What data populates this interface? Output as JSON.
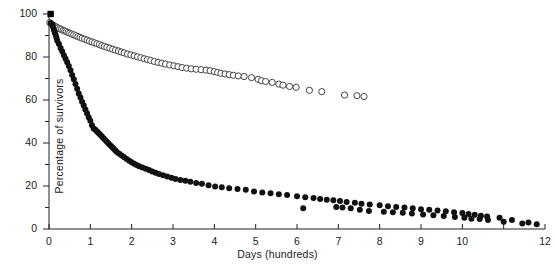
{
  "chart_data": {
    "type": "scatter",
    "title": "",
    "xlabel": "Days (hundreds)",
    "ylabel": "Percentage of survivors",
    "xlim": [
      0,
      12
    ],
    "ylim": [
      0,
      100
    ],
    "xticks": [
      0,
      1,
      2,
      3,
      4,
      5,
      6,
      7,
      8,
      9,
      10,
      11,
      12
    ],
    "xtick_labels": [
      "0",
      "1",
      "2",
      "3",
      "4",
      "5",
      "6",
      "7",
      "8",
      "9",
      "10",
      "11",
      "12"
    ],
    "xtick_labeled": [
      true,
      true,
      true,
      true,
      true,
      true,
      true,
      true,
      true,
      true,
      true,
      false,
      true
    ],
    "yticks": [
      0,
      10,
      20,
      30,
      40,
      50,
      60,
      70,
      80,
      90,
      100
    ],
    "ytick_labels": [
      "0",
      "",
      "20",
      "",
      "40",
      "",
      "60",
      "",
      "80",
      "",
      "100"
    ],
    "grid": false,
    "legend": "none",
    "series": [
      {
        "name": "open-circle-series",
        "marker": "open-circle",
        "color": "#444444",
        "points": [
          [
            0.02,
            96.0
          ],
          [
            0.06,
            95.2
          ],
          [
            0.1,
            94.8
          ],
          [
            0.14,
            94.3
          ],
          [
            0.18,
            93.9
          ],
          [
            0.22,
            93.5
          ],
          [
            0.26,
            93.1
          ],
          [
            0.3,
            92.8
          ],
          [
            0.34,
            92.4
          ],
          [
            0.38,
            92.1
          ],
          [
            0.42,
            91.8
          ],
          [
            0.46,
            91.4
          ],
          [
            0.5,
            91.1
          ],
          [
            0.55,
            90.7
          ],
          [
            0.6,
            90.3
          ],
          [
            0.65,
            89.9
          ],
          [
            0.7,
            89.5
          ],
          [
            0.75,
            89.1
          ],
          [
            0.8,
            88.7
          ],
          [
            0.86,
            88.3
          ],
          [
            0.92,
            87.9
          ],
          [
            0.98,
            87.4
          ],
          [
            1.04,
            87.0
          ],
          [
            1.1,
            86.6
          ],
          [
            1.16,
            86.2
          ],
          [
            1.22,
            85.8
          ],
          [
            1.28,
            85.3
          ],
          [
            1.34,
            84.9
          ],
          [
            1.4,
            84.5
          ],
          [
            1.47,
            84.1
          ],
          [
            1.54,
            83.6
          ],
          [
            1.61,
            83.2
          ],
          [
            1.68,
            82.8
          ],
          [
            1.75,
            82.3
          ],
          [
            1.82,
            81.9
          ],
          [
            1.9,
            81.4
          ],
          [
            1.98,
            81.0
          ],
          [
            2.06,
            80.5
          ],
          [
            2.14,
            80.1
          ],
          [
            2.22,
            79.7
          ],
          [
            2.3,
            79.2
          ],
          [
            2.38,
            78.8
          ],
          [
            2.46,
            78.4
          ],
          [
            2.55,
            77.9
          ],
          [
            2.64,
            77.5
          ],
          [
            2.73,
            77.1
          ],
          [
            2.82,
            76.7
          ],
          [
            2.92,
            76.3
          ],
          [
            3.02,
            75.9
          ],
          [
            3.12,
            75.5
          ],
          [
            3.22,
            75.1
          ],
          [
            3.33,
            74.8
          ],
          [
            3.44,
            74.5
          ],
          [
            3.56,
            74.3
          ],
          [
            3.68,
            74.1
          ],
          [
            3.8,
            73.9
          ],
          [
            3.9,
            73.6
          ],
          [
            4.0,
            73.2
          ],
          [
            4.08,
            72.8
          ],
          [
            4.16,
            72.4
          ],
          [
            4.26,
            72.1
          ],
          [
            4.36,
            71.8
          ],
          [
            4.46,
            71.5
          ],
          [
            4.58,
            71.2
          ],
          [
            4.72,
            70.9
          ],
          [
            4.9,
            70.4
          ],
          [
            5.06,
            69.6
          ],
          [
            5.14,
            69.0
          ],
          [
            5.24,
            68.6
          ],
          [
            5.4,
            68.2
          ],
          [
            5.56,
            67.4
          ],
          [
            5.66,
            66.9
          ],
          [
            5.82,
            66.3
          ],
          [
            5.98,
            65.9
          ],
          [
            6.3,
            64.5
          ],
          [
            6.6,
            63.9
          ],
          [
            7.15,
            62.3
          ],
          [
            7.45,
            62.0
          ],
          [
            7.62,
            61.6
          ]
        ]
      },
      {
        "name": "filled-circle-series",
        "marker": "filled-circle",
        "color": "#111111",
        "points": [
          [
            0.04,
            95.8
          ],
          [
            0.08,
            95.0
          ],
          [
            0.1,
            93.8
          ],
          [
            0.12,
            92.6
          ],
          [
            0.14,
            91.4
          ],
          [
            0.16,
            90.2
          ],
          [
            0.18,
            89.0
          ],
          [
            0.2,
            87.6
          ],
          [
            0.24,
            86.0
          ],
          [
            0.28,
            84.2
          ],
          [
            0.32,
            82.6
          ],
          [
            0.36,
            80.8
          ],
          [
            0.4,
            79.2
          ],
          [
            0.44,
            77.6
          ],
          [
            0.48,
            75.8
          ],
          [
            0.52,
            73.8
          ],
          [
            0.56,
            71.6
          ],
          [
            0.6,
            69.6
          ],
          [
            0.64,
            67.4
          ],
          [
            0.68,
            65.2
          ],
          [
            0.72,
            63.0
          ],
          [
            0.76,
            61.2
          ],
          [
            0.8,
            59.2
          ],
          [
            0.84,
            57.4
          ],
          [
            0.88,
            55.6
          ],
          [
            0.92,
            53.8
          ],
          [
            0.96,
            52.0
          ],
          [
            1.0,
            50.4
          ],
          [
            1.04,
            48.2
          ],
          [
            1.08,
            46.8
          ],
          [
            1.12,
            46.2
          ],
          [
            1.16,
            45.4
          ],
          [
            1.2,
            44.6
          ],
          [
            1.24,
            43.8
          ],
          [
            1.28,
            43.0
          ],
          [
            1.32,
            42.2
          ],
          [
            1.36,
            41.4
          ],
          [
            1.4,
            40.6
          ],
          [
            1.44,
            39.8
          ],
          [
            1.48,
            39.0
          ],
          [
            1.52,
            38.2
          ],
          [
            1.56,
            37.4
          ],
          [
            1.6,
            36.6
          ],
          [
            1.64,
            35.8
          ],
          [
            1.7,
            35.0
          ],
          [
            1.76,
            34.2
          ],
          [
            1.82,
            33.4
          ],
          [
            1.88,
            32.6
          ],
          [
            1.94,
            31.8
          ],
          [
            2.0,
            31.0
          ],
          [
            2.06,
            30.4
          ],
          [
            2.12,
            29.8
          ],
          [
            2.18,
            29.2
          ],
          [
            2.26,
            28.6
          ],
          [
            2.34,
            28.0
          ],
          [
            2.42,
            27.4
          ],
          [
            2.5,
            26.8
          ],
          [
            2.58,
            26.2
          ],
          [
            2.66,
            25.6
          ],
          [
            2.76,
            25.0
          ],
          [
            2.86,
            24.4
          ],
          [
            2.96,
            23.8
          ],
          [
            3.06,
            23.2
          ],
          [
            3.18,
            22.8
          ],
          [
            3.3,
            22.4
          ],
          [
            3.42,
            22.0
          ],
          [
            3.56,
            21.4
          ],
          [
            3.7,
            21.0
          ],
          [
            3.86,
            20.4
          ],
          [
            4.02,
            19.8
          ],
          [
            4.18,
            19.4
          ],
          [
            4.36,
            19.0
          ],
          [
            4.56,
            18.6
          ],
          [
            4.76,
            18.2
          ],
          [
            4.96,
            17.4
          ],
          [
            5.16,
            17.0
          ],
          [
            5.36,
            16.6
          ],
          [
            5.56,
            16.2
          ],
          [
            5.76,
            15.8
          ],
          [
            6.0,
            15.2
          ],
          [
            6.2,
            14.8
          ],
          [
            6.4,
            14.4
          ],
          [
            6.56,
            14.0
          ],
          [
            6.72,
            13.6
          ],
          [
            6.88,
            13.4
          ],
          [
            7.04,
            13.0
          ],
          [
            7.2,
            12.6
          ],
          [
            7.4,
            12.2
          ],
          [
            7.56,
            11.8
          ],
          [
            7.76,
            11.4
          ],
          [
            8.0,
            11.0
          ],
          [
            8.2,
            10.6
          ],
          [
            8.4,
            10.2
          ],
          [
            8.6,
            10.0
          ],
          [
            8.8,
            9.6
          ],
          [
            9.0,
            9.2
          ],
          [
            9.2,
            9.0
          ],
          [
            9.4,
            8.6
          ],
          [
            9.6,
            8.2
          ],
          [
            9.8,
            7.8
          ],
          [
            10.0,
            7.4
          ],
          [
            10.15,
            7.0
          ],
          [
            10.3,
            6.6
          ],
          [
            10.45,
            6.2
          ],
          [
            10.6,
            5.8
          ],
          [
            10.9,
            5.2
          ],
          [
            11.2,
            4.2
          ],
          [
            11.6,
            3.0
          ],
          [
            11.8,
            2.2
          ],
          [
            6.15,
            9.6
          ],
          [
            6.95,
            10.2
          ],
          [
            7.1,
            10.0
          ],
          [
            7.3,
            9.6
          ],
          [
            7.52,
            9.0
          ],
          [
            7.74,
            8.4
          ],
          [
            8.1,
            8.0
          ],
          [
            8.32,
            7.8
          ],
          [
            8.56,
            7.6
          ],
          [
            8.78,
            7.2
          ],
          [
            9.05,
            6.8
          ],
          [
            9.3,
            6.4
          ],
          [
            9.55,
            6.0
          ],
          [
            9.82,
            5.6
          ],
          [
            10.05,
            5.2
          ],
          [
            10.22,
            4.8
          ],
          [
            10.42,
            4.6
          ],
          [
            10.62,
            4.2
          ],
          [
            11.0,
            3.4
          ],
          [
            11.45,
            2.6
          ]
        ]
      },
      {
        "name": "origin-square-marker",
        "marker": "filled-square",
        "color": "#000000",
        "points": [
          [
            0.04,
            100.0
          ]
        ]
      }
    ]
  }
}
